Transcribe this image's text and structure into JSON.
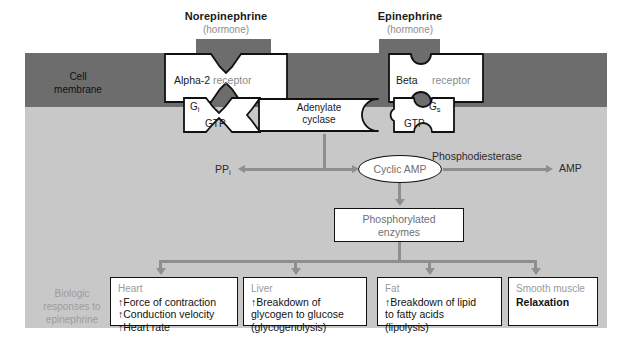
{
  "figure": {
    "type": "signal-transduction-diagram",
    "cell_membrane_label": "Cell\nmembrane",
    "biologic_label": "Biologic\nresponses to\nepinephrine"
  },
  "hormones": [
    {
      "name": "Norepinephrine",
      "sub": "(hormone)"
    },
    {
      "name": "Epinephrine",
      "sub": "(hormone)"
    }
  ],
  "receptors": [
    {
      "name": "Alpha-2",
      "suffix": "receptor"
    },
    {
      "name": "Beta",
      "suffix": "receptor"
    }
  ],
  "gproteins": [
    {
      "name": "G",
      "subscript": "i",
      "ligand": "GTP"
    },
    {
      "name": "G",
      "subscript": "s",
      "ligand": "GTP"
    }
  ],
  "enzyme": {
    "line1": "Adenylate",
    "line2": "cyclase"
  },
  "messengers": {
    "cyclic_amp": "Cyclic AMP",
    "ppi": "PP",
    "ppi_sub": "i",
    "amp": "AMP",
    "phosphodiesterase": "Phosphodiesterase"
  },
  "phosphorylated": {
    "line1": "Phosphorylated",
    "line2": "enzymes"
  },
  "responses": [
    {
      "title": "Heart",
      "lines": [
        "↑Force of contraction",
        "↑Conduction velocity",
        "↑Heart rate"
      ]
    },
    {
      "title": "Liver",
      "lines": [
        "↑Breakdown of",
        "glycogen to glucose",
        "(glycogenolysis)"
      ]
    },
    {
      "title": "Fat",
      "lines": [
        "↑Breakdown of lipid",
        "to fatty acids",
        "(lipolysis)"
      ]
    },
    {
      "title": "Smooth muscle",
      "lines": [
        "Relaxation"
      ]
    }
  ],
  "colors": {
    "membrane": "#6d6d6d",
    "cytoplasm": "#c8c8c8",
    "connector": "#8e8e8e",
    "ink": "#111111",
    "muted": "#9a9a9a"
  }
}
